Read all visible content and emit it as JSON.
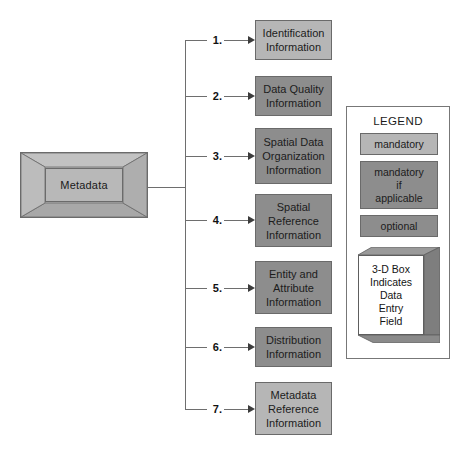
{
  "diagram": {
    "root": {
      "label": "Metadata",
      "style": "3d-box"
    },
    "branches": [
      {
        "num": "1.",
        "label": "Identification\nInformation",
        "category": "mandatory"
      },
      {
        "num": "2.",
        "label": "Data Quality\nInformation",
        "category": "mandatory if applicable"
      },
      {
        "num": "3.",
        "label": "Spatial Data\nOrganization\nInformation",
        "category": "mandatory if applicable"
      },
      {
        "num": "4.",
        "label": "Spatial\nReference\nInformation",
        "category": "mandatory if applicable"
      },
      {
        "num": "5.",
        "label": "Entity and\nAttribute\nInformation",
        "category": "mandatory if applicable"
      },
      {
        "num": "6.",
        "label": "Distribution\nInformation",
        "category": "mandatory if applicable"
      },
      {
        "num": "7.",
        "label": "Metadata\nReference\nInformation",
        "category": "mandatory"
      }
    ]
  },
  "legend": {
    "title": "LEGEND",
    "items": [
      {
        "label": "mandatory",
        "color": "#b6b6b6"
      },
      {
        "label": "mandatory\nif\napplicable",
        "color": "#8d8d8d"
      },
      {
        "label": "optional",
        "color": "#8d8d8d"
      }
    ],
    "box_note": "3-D Box\nIndicates\nData\nEntry\nField"
  },
  "colors": {
    "mandatory": "#b6b6b6",
    "mandatory_if_applicable": "#8d8d8d",
    "optional": "#8d8d8d",
    "line": "#6e6e6e",
    "border": "#6a6a6a",
    "background": "#ffffff"
  }
}
